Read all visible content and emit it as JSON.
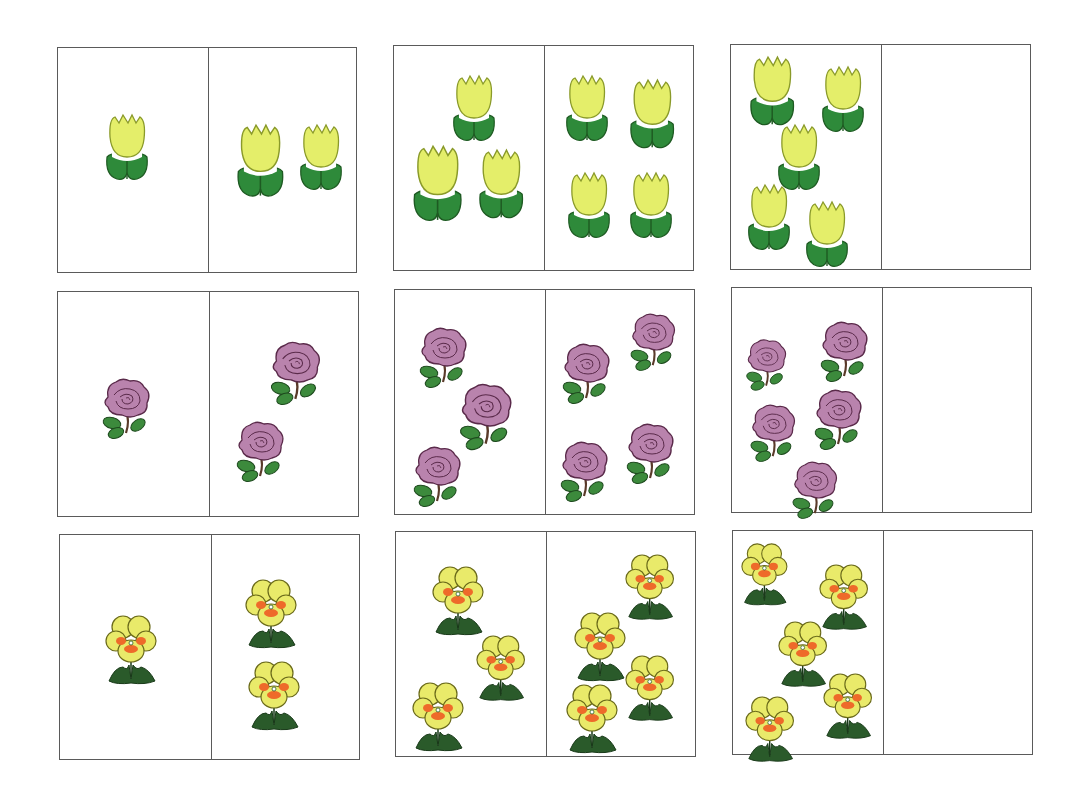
{
  "worksheet": {
    "title": "",
    "colors": {
      "tulip_petal": "#e4ee6a",
      "tulip_outline": "#8a9a2a",
      "tulip_leaf": "#2e8a3a",
      "tulip_leaf_dark": "#1e5a22",
      "rose_petal": "#b983ad",
      "rose_outline": "#5a2a4a",
      "rose_leaf": "#3c8a3c",
      "pansy_petal": "#e9ea6a",
      "pansy_outline": "#6a6a1a",
      "pansy_center": "#ee6a2a",
      "pansy_leaf": "#2a5a2a",
      "border": "#5a5a5a"
    },
    "cards": [
      {
        "id": "tulip-1-2",
        "x": 57,
        "y": 47,
        "w": 300,
        "h": 226,
        "split": 150,
        "flower": "tulip",
        "left": {
          "count": 1,
          "items": [
            {
              "x": 45,
              "y": 65,
              "s": 1.0
            }
          ]
        },
        "right": {
          "count": 2,
          "items": [
            {
              "x": 25,
              "y": 75,
              "s": 1.1
            },
            {
              "x": 88,
              "y": 75,
              "s": 1.0
            }
          ]
        }
      },
      {
        "id": "tulip-3-4",
        "x": 393,
        "y": 45,
        "w": 301,
        "h": 226,
        "split": 150,
        "flower": "tulip",
        "left": {
          "count": 3,
          "items": [
            {
              "x": 56,
              "y": 28,
              "s": 1.0
            },
            {
              "x": 16,
              "y": 98,
              "s": 1.15
            },
            {
              "x": 82,
              "y": 102,
              "s": 1.05
            }
          ]
        },
        "right": {
          "count": 4,
          "items": [
            {
              "x": 18,
              "y": 28,
              "s": 1.0
            },
            {
              "x": 82,
              "y": 32,
              "s": 1.05
            },
            {
              "x": 20,
              "y": 125,
              "s": 1.0
            },
            {
              "x": 82,
              "y": 125,
              "s": 1.0
            }
          ]
        }
      },
      {
        "id": "tulip-5-blank",
        "x": 730,
        "y": 44,
        "w": 301,
        "h": 226,
        "split": 150,
        "flower": "tulip",
        "left": {
          "count": 5,
          "items": [
            {
              "x": 16,
              "y": 10,
              "s": 1.05
            },
            {
              "x": 88,
              "y": 20,
              "s": 1.0
            },
            {
              "x": 44,
              "y": 78,
              "s": 1.0
            },
            {
              "x": 14,
              "y": 138,
              "s": 1.0
            },
            {
              "x": 72,
              "y": 155,
              "s": 1.0
            }
          ]
        },
        "right": {
          "count": 0,
          "items": []
        }
      },
      {
        "id": "rose-1-2",
        "x": 57,
        "y": 291,
        "w": 302,
        "h": 226,
        "split": 151,
        "flower": "rose",
        "left": {
          "count": 1,
          "items": [
            {
              "x": 42,
              "y": 85,
              "s": 1.0
            }
          ]
        },
        "right": {
          "count": 2,
          "items": [
            {
              "x": 58,
              "y": 48,
              "s": 1.05
            },
            {
              "x": 24,
              "y": 128,
              "s": 1.0
            }
          ]
        }
      },
      {
        "id": "rose-3-4",
        "x": 394,
        "y": 289,
        "w": 301,
        "h": 226,
        "split": 150,
        "flower": "rose",
        "left": {
          "count": 3,
          "items": [
            {
              "x": 22,
              "y": 36,
              "s": 1.0
            },
            {
              "x": 62,
              "y": 92,
              "s": 1.1
            },
            {
              "x": 16,
              "y": 155,
              "s": 1.0
            }
          ]
        },
        "right": {
          "count": 4,
          "items": [
            {
              "x": 14,
              "y": 52,
              "s": 1.0
            },
            {
              "x": 82,
              "y": 22,
              "s": 0.95
            },
            {
              "x": 12,
              "y": 150,
              "s": 1.0
            },
            {
              "x": 78,
              "y": 132,
              "s": 1.0
            }
          ]
        }
      },
      {
        "id": "rose-5-blank",
        "x": 731,
        "y": 287,
        "w": 301,
        "h": 226,
        "split": 150,
        "flower": "rose",
        "left": {
          "count": 5,
          "items": [
            {
              "x": 12,
              "y": 50,
              "s": 0.85
            },
            {
              "x": 86,
              "y": 32,
              "s": 1.0
            },
            {
              "x": 16,
              "y": 115,
              "s": 0.95
            },
            {
              "x": 80,
              "y": 100,
              "s": 1.0
            },
            {
              "x": 58,
              "y": 172,
              "s": 0.95
            }
          ]
        },
        "right": {
          "count": 0,
          "items": []
        }
      },
      {
        "id": "pansy-1-2",
        "x": 59,
        "y": 534,
        "w": 301,
        "h": 226,
        "split": 151,
        "flower": "pansy",
        "left": {
          "count": 1,
          "items": [
            {
              "x": 45,
              "y": 80,
              "s": 1.0
            }
          ]
        },
        "right": {
          "count": 2,
          "items": [
            {
              "x": 33,
              "y": 44,
              "s": 1.0
            },
            {
              "x": 36,
              "y": 126,
              "s": 1.0
            }
          ]
        }
      },
      {
        "id": "pansy-3-4",
        "x": 395,
        "y": 531,
        "w": 301,
        "h": 226,
        "split": 150,
        "flower": "pansy",
        "left": {
          "count": 3,
          "items": [
            {
              "x": 36,
              "y": 34,
              "s": 1.0
            },
            {
              "x": 80,
              "y": 103,
              "s": 0.95
            },
            {
              "x": 16,
              "y": 150,
              "s": 1.0
            }
          ]
        },
        "right": {
          "count": 4,
          "items": [
            {
              "x": 78,
              "y": 22,
              "s": 0.95
            },
            {
              "x": 27,
              "y": 80,
              "s": 1.0
            },
            {
              "x": 78,
              "y": 123,
              "s": 0.95
            },
            {
              "x": 19,
              "y": 152,
              "s": 1.0
            }
          ]
        }
      },
      {
        "id": "pansy-5-blank",
        "x": 732,
        "y": 530,
        "w": 301,
        "h": 225,
        "split": 150,
        "flower": "pansy",
        "left": {
          "count": 5,
          "items": [
            {
              "x": 8,
              "y": 12,
              "s": 0.9
            },
            {
              "x": 86,
              "y": 33,
              "s": 0.95
            },
            {
              "x": 45,
              "y": 90,
              "s": 0.95
            },
            {
              "x": 90,
              "y": 142,
              "s": 0.95
            },
            {
              "x": 12,
              "y": 165,
              "s": 0.95
            }
          ]
        },
        "right": {
          "count": 0,
          "items": []
        }
      }
    ]
  }
}
